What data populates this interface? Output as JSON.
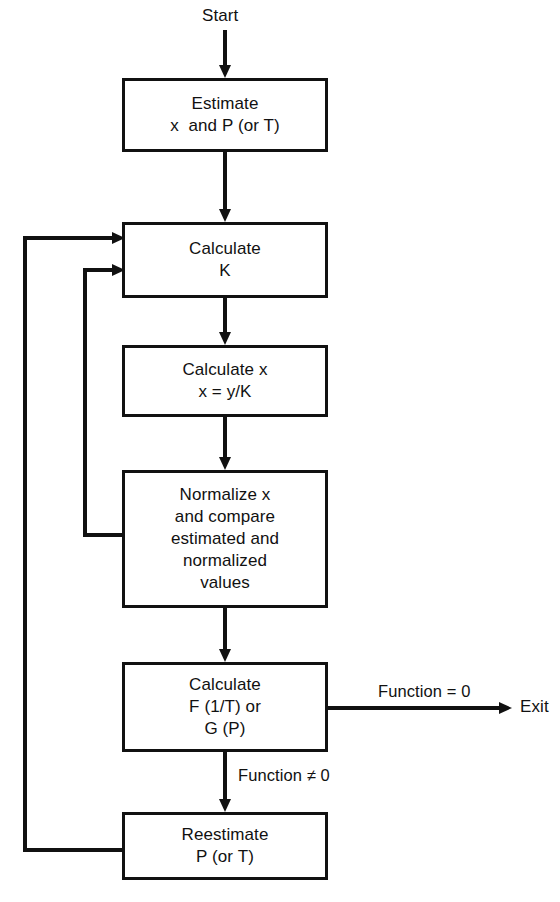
{
  "diagram": {
    "background_color": "#ffffff",
    "line_color": "#111111",
    "text_color": "#111111"
  },
  "terminals": {
    "start": "Start",
    "exit": "Exit"
  },
  "nodes": [
    {
      "id": "estimate",
      "lines": [
        "Estimate",
        "x  and P (or T)"
      ],
      "x": 122,
      "y": 78,
      "w": 206,
      "h": 74
    },
    {
      "id": "calculate-k",
      "lines": [
        "Calculate",
        "K"
      ],
      "x": 122,
      "y": 222,
      "w": 206,
      "h": 76
    },
    {
      "id": "calculate-x",
      "lines": [
        "Calculate x",
        "x = y/K"
      ],
      "x": 122,
      "y": 345,
      "w": 206,
      "h": 72
    },
    {
      "id": "normalize",
      "lines": [
        "Normalize x",
        "and compare",
        "estimated and",
        "normalized",
        "values"
      ],
      "x": 122,
      "y": 470,
      "w": 206,
      "h": 138
    },
    {
      "id": "calculate-f",
      "lines": [
        "Calculate",
        "F (1/T) or",
        "G (P)"
      ],
      "x": 122,
      "y": 662,
      "w": 206,
      "h": 90
    },
    {
      "id": "reestimate",
      "lines": [
        "Reestimate",
        "P (or T)"
      ],
      "x": 122,
      "y": 812,
      "w": 206,
      "h": 68
    }
  ],
  "edge_labels": [
    {
      "id": "function-equals-zero",
      "text": "Function = 0",
      "x": 378,
      "y": 684
    },
    {
      "id": "function-not-zero",
      "text": "Function ≠ 0",
      "x": 238,
      "y": 769
    }
  ],
  "free_labels": [
    {
      "id": "start-label",
      "text": "Start",
      "x": 202,
      "y": 6
    },
    {
      "id": "exit-label",
      "text": "Exit",
      "x": 520,
      "y": 697
    }
  ],
  "connectors": [
    {
      "id": "start-to-estimate",
      "from": "start",
      "to": "estimate",
      "kind": "arrow-down"
    },
    {
      "id": "estimate-to-calculate-k",
      "from": "estimate",
      "to": "calculate-k",
      "kind": "arrow-down"
    },
    {
      "id": "calculate-k-to-calculate-x",
      "from": "calculate-k",
      "to": "calculate-x",
      "kind": "arrow-down"
    },
    {
      "id": "calculate-x-to-normalize",
      "from": "calculate-x",
      "to": "normalize",
      "kind": "arrow-down"
    },
    {
      "id": "normalize-to-calculate-f",
      "from": "normalize",
      "to": "calculate-f",
      "kind": "arrow-down"
    },
    {
      "id": "calculate-f-to-reestimate",
      "from": "calculate-f",
      "to": "reestimate",
      "kind": "arrow-down",
      "label": "Function ≠ 0"
    },
    {
      "id": "calculate-f-to-exit",
      "from": "calculate-f",
      "to": "exit",
      "kind": "arrow-right",
      "label": "Function = 0"
    },
    {
      "id": "normalize-feedback-to-calculate-k",
      "from": "normalize",
      "to": "calculate-k",
      "kind": "feedback-inner"
    },
    {
      "id": "reestimate-feedback-to-calculate-k",
      "from": "reestimate",
      "to": "calculate-k",
      "kind": "feedback-outer"
    }
  ]
}
